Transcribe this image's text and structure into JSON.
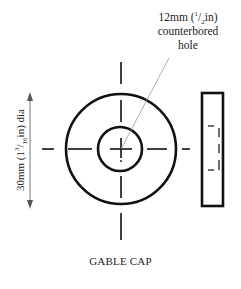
{
  "diagram": {
    "type": "technical-drawing",
    "subject": "gable cap",
    "caption": "GABLE CAP",
    "callout": {
      "line1_prefix": "12mm (",
      "line1_frac_num": "1",
      "line1_frac_den": "2",
      "line1_suffix": "in)",
      "line2": "counterbored",
      "line3": "hole"
    },
    "dimension": {
      "prefix": "30mm (1",
      "frac_num": "3",
      "frac_den": "16",
      "suffix": "in) dia"
    },
    "front_view": {
      "outer_circle": {
        "cx": 121,
        "cy": 149,
        "r": 55
      },
      "inner_circle": {
        "cx": 120,
        "cy": 149,
        "r": 22
      }
    },
    "side_view": {
      "x": 202,
      "y": 93,
      "width": 21,
      "height": 113
    },
    "colors": {
      "line": "#111111",
      "leader": "#888888",
      "text": "#222222",
      "background": "#ffffff"
    }
  }
}
